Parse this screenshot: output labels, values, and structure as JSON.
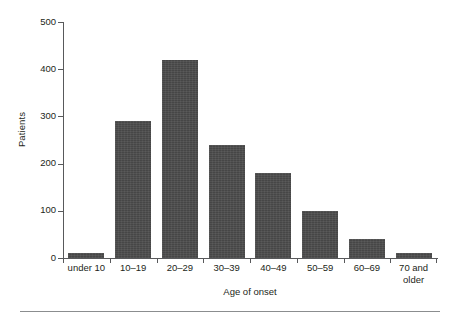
{
  "chart_data": {
    "type": "bar",
    "title": "",
    "xlabel": "Age of onset",
    "ylabel": "Patients",
    "categories": [
      "under 10",
      "10–19",
      "20–29",
      "30–39",
      "40–49",
      "50–59",
      "60–69",
      "70 and older"
    ],
    "values": [
      10,
      290,
      420,
      240,
      180,
      100,
      40,
      10
    ],
    "ylim": [
      0,
      500
    ],
    "yticks": [
      0,
      100,
      200,
      300,
      400,
      500
    ],
    "ytick_labels": [
      "0",
      "100",
      "200",
      "300",
      "400",
      "500"
    ],
    "grid": false,
    "legend": null,
    "bar_color": "#4d4d4d",
    "axis_color": "#58595b",
    "text_color": "#231f20"
  }
}
